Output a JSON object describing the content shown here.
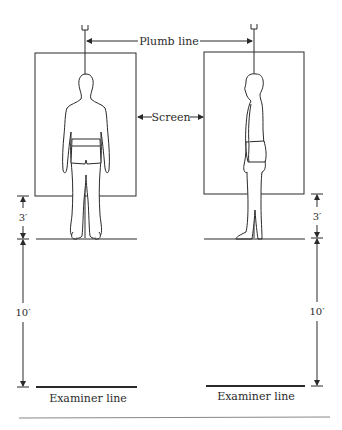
{
  "diagram": {
    "labels": {
      "plumb_line": "Plumb line",
      "screen": "Screen",
      "examiner_line_left": "Examiner line",
      "examiner_line_right": "Examiner line"
    },
    "dimensions": {
      "left_upper": "3′",
      "left_lower": "10′",
      "right_upper": "3′",
      "right_lower": "10′"
    },
    "views": [
      {
        "name": "posterior-view",
        "description": "Figure viewed from behind, standing in front of screen with plumb line"
      },
      {
        "name": "lateral-view",
        "description": "Figure viewed from side, standing in front of screen with plumb line"
      }
    ],
    "colors": {
      "line": "#2a2a2a",
      "background": "#ffffff"
    }
  }
}
